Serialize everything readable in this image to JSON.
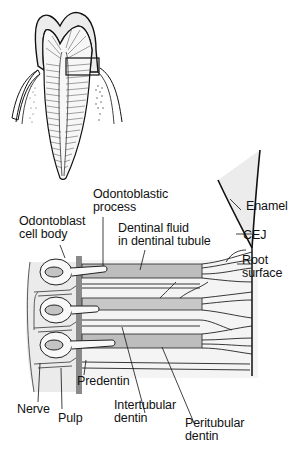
{
  "diagram": {
    "type": "tooth-dentin-anatomy",
    "colors": {
      "outline": "#111111",
      "enamel_fill": "#ececec",
      "dentin_fill": "#f2f2f2",
      "tubule_fill": "#bdbdbd",
      "pulp_fill": "#e9e9e9",
      "predentin": "#8a8a8a"
    },
    "labels": {
      "odontoblastic_process": [
        "Odontoblastic",
        "process"
      ],
      "odontoblast_cell_body": [
        "Odontoblast",
        "cell body"
      ],
      "dentinal_fluid": [
        "Dentinal fluid",
        "in dentinal tubule"
      ],
      "enamel": "Enamel",
      "cej": "CEJ",
      "root_surface": [
        "Root",
        "surface"
      ],
      "predentin": "Predentin",
      "nerve": "Nerve",
      "pulp": "Pulp",
      "intertubular_dentin": [
        "Intertubular",
        "dentin"
      ],
      "peritubular_dentin": [
        "Peritubular",
        "dentin"
      ]
    }
  }
}
